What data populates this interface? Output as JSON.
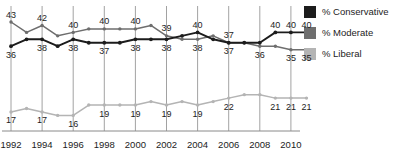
{
  "chart_data": {
    "type": "line",
    "title": "",
    "xlabel": "",
    "ylabel": "",
    "ylim": [
      10,
      46
    ],
    "grid": "vertical-only",
    "legend_position": "right",
    "x": [
      1992,
      1993,
      1994,
      1995,
      1996,
      1997,
      1998,
      1999,
      2000,
      2001,
      2002,
      2003,
      2004,
      2005,
      2006,
      2007,
      2008,
      2009,
      2010,
      2011
    ],
    "tick_labels": [
      "1992",
      "1994",
      "1996",
      "1998",
      "2000",
      "2002",
      "2004",
      "2006",
      "2008",
      "2010"
    ],
    "tick_values": [
      1992,
      1994,
      1996,
      1998,
      2000,
      2002,
      2004,
      2006,
      2008,
      2010
    ],
    "series": [
      {
        "name": "% Conservative",
        "color": "#1c1c1c",
        "values": [
          36,
          38,
          38,
          36,
          38,
          37,
          37,
          37,
          38,
          38,
          38,
          39,
          40,
          38,
          37,
          37,
          37,
          40,
          40,
          40
        ],
        "labels": [
          {
            "x": 1992,
            "value": "36",
            "pos": "below"
          },
          {
            "x": 1994,
            "value": "38",
            "pos": "below"
          },
          {
            "x": 1996,
            "value": "38",
            "pos": "below"
          },
          {
            "x": 1998,
            "value": "37",
            "pos": "below"
          },
          {
            "x": 2000,
            "value": "38",
            "pos": "below"
          },
          {
            "x": 2002,
            "value": "38",
            "pos": "below"
          },
          {
            "x": 2004,
            "value": "40",
            "pos": "above"
          },
          {
            "x": 2006,
            "value": "37",
            "pos": "above"
          },
          {
            "x": 2009,
            "value": "40",
            "pos": "above"
          },
          {
            "x": 2010,
            "value": "40",
            "pos": "above"
          },
          {
            "x": 2011,
            "value": "40",
            "pos": "above"
          }
        ]
      },
      {
        "name": "% Moderate",
        "color": "#6e6e6e",
        "values": [
          43,
          40,
          42,
          39,
          40,
          41,
          41,
          41,
          41,
          42,
          39,
          38,
          38,
          39,
          37,
          37,
          36,
          36,
          35,
          35
        ],
        "labels": [
          {
            "x": 1992,
            "value": "43",
            "pos": "above"
          },
          {
            "x": 1994,
            "value": "42",
            "pos": "above"
          },
          {
            "x": 1996,
            "value": "40",
            "pos": "above"
          },
          {
            "x": 1998,
            "value": "40",
            "pos": "above"
          },
          {
            "x": 2000,
            "value": "40",
            "pos": "above"
          },
          {
            "x": 2002,
            "value": "39",
            "pos": "above"
          },
          {
            "x": 2004,
            "value": "38",
            "pos": "below"
          },
          {
            "x": 2006,
            "value": "37",
            "pos": "below"
          },
          {
            "x": 2008,
            "value": "36",
            "pos": "below"
          },
          {
            "x": 2010,
            "value": "35",
            "pos": "below"
          },
          {
            "x": 2011,
            "value": "35",
            "pos": "below"
          }
        ]
      },
      {
        "name": "% Liberal",
        "color": "#b4b4b4",
        "values": [
          17,
          18,
          17,
          16,
          16,
          19,
          19,
          19,
          19,
          20,
          19,
          20,
          19,
          20,
          21,
          22,
          22,
          21,
          21,
          21
        ],
        "labels": [
          {
            "x": 1992,
            "value": "17",
            "pos": "below"
          },
          {
            "x": 1994,
            "value": "17",
            "pos": "below"
          },
          {
            "x": 1996,
            "value": "16",
            "pos": "below"
          },
          {
            "x": 1998,
            "value": "19",
            "pos": "below"
          },
          {
            "x": 2000,
            "value": "19",
            "pos": "below"
          },
          {
            "x": 2002,
            "value": "19",
            "pos": "below"
          },
          {
            "x": 2004,
            "value": "19",
            "pos": "below"
          },
          {
            "x": 2006,
            "value": "22",
            "pos": "below"
          },
          {
            "x": 2009,
            "value": "21",
            "pos": "below"
          },
          {
            "x": 2010,
            "value": "21",
            "pos": "below"
          },
          {
            "x": 2011,
            "value": "21",
            "pos": "below"
          }
        ]
      }
    ]
  },
  "legend": {
    "items": [
      {
        "label": "% Conservative",
        "color": "#1c1c1c"
      },
      {
        "label": "% Moderate",
        "color": "#6e6e6e"
      },
      {
        "label": "% Liberal",
        "color": "#b4b4b4"
      }
    ]
  },
  "axis": {
    "line_color": "#8a8a8a",
    "grid_color": "#8a8a8a"
  }
}
